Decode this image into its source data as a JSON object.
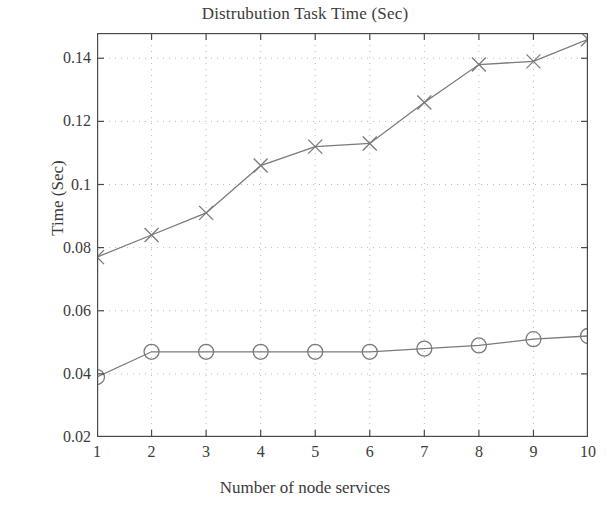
{
  "chart_data": {
    "type": "line",
    "title": "Distrubution Task Time (Sec)",
    "xlabel": "Number of node services",
    "ylabel": "Time (Sec)",
    "x": [
      1,
      2,
      3,
      4,
      5,
      6,
      7,
      8,
      9,
      10
    ],
    "xlim": [
      1,
      10
    ],
    "ylim": [
      0.02,
      0.148
    ],
    "xticks": [
      "1",
      "2",
      "3",
      "4",
      "5",
      "6",
      "7",
      "8",
      "9",
      "10"
    ],
    "yticks": [
      "0.02",
      "0.04",
      "0.06",
      "0.08",
      "0.1",
      "0.12",
      "0.14"
    ],
    "ytick_values": [
      0.02,
      0.04,
      0.06,
      0.08,
      0.1,
      0.12,
      0.14
    ],
    "grid": true,
    "grid_style": "dotted",
    "legend": "none",
    "series": [
      {
        "name": "cross-series",
        "marker": "x",
        "color": "#7a7a7a",
        "values": [
          0.077,
          0.084,
          0.091,
          0.106,
          0.112,
          0.113,
          0.126,
          0.138,
          0.139,
          0.146
        ]
      },
      {
        "name": "circle-series",
        "marker": "o",
        "color": "#7a7a7a",
        "values": [
          0.039,
          0.047,
          0.047,
          0.047,
          0.047,
          0.047,
          0.048,
          0.049,
          0.051,
          0.052
        ]
      }
    ]
  },
  "colors": {
    "axis": "#4a4a4a",
    "grid": "#b9b9b9",
    "line": "#7a7a7a",
    "background": "#ffffff",
    "text": "#3b3b3b"
  }
}
